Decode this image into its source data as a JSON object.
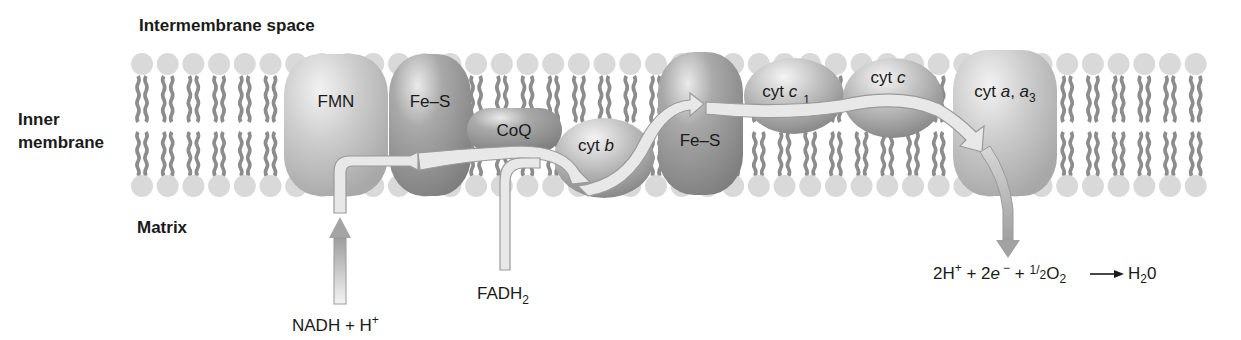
{
  "regions": {
    "intermembrane_space": "Intermembrane space",
    "inner_membrane_line1": "Inner",
    "inner_membrane_line2": "membrane",
    "matrix": "Matrix"
  },
  "complexes": [
    {
      "id": "fmn",
      "label": "FMN"
    },
    {
      "id": "fes1",
      "label": "Fe–S"
    },
    {
      "id": "coq",
      "label": "CoQ"
    },
    {
      "id": "cytb",
      "label": "cyt ",
      "italic": "b"
    },
    {
      "id": "fes2",
      "label": "Fe–S"
    },
    {
      "id": "cytc1",
      "label": "cyt ",
      "italic": "c",
      "subscript": "1"
    },
    {
      "id": "cytc",
      "label": "cyt ",
      "italic": "c"
    },
    {
      "id": "cytaa3",
      "label": "cyt ",
      "italic_a": "a",
      "sep": ", ",
      "italic_a3": "a",
      "subscript": "3"
    }
  ],
  "inputs": {
    "nadh": {
      "main": "NADH + H",
      "sup": "+"
    },
    "fadh2": {
      "main": "FADH",
      "sub": "2"
    }
  },
  "equation": {
    "t1": "2H",
    "s1": "+",
    "t2": " + 2",
    "e": "e",
    "s2": "−",
    "t3": " + ",
    "half_num": "1",
    "half_den": "2",
    "o": "O",
    "o_sub": "2",
    "h": "H",
    "h_sub": "2",
    "h_end": "0"
  },
  "colors": {
    "lipid_head": "#d9d9d9",
    "lipid_tail": "#8c8c8c",
    "protein_light": "#c8c8c8",
    "protein_dark": "#9a9a9a",
    "ribbon": "#e6e6e6",
    "ribbon_stroke": "#9c9c9c",
    "text": "#1a1a1a"
  }
}
